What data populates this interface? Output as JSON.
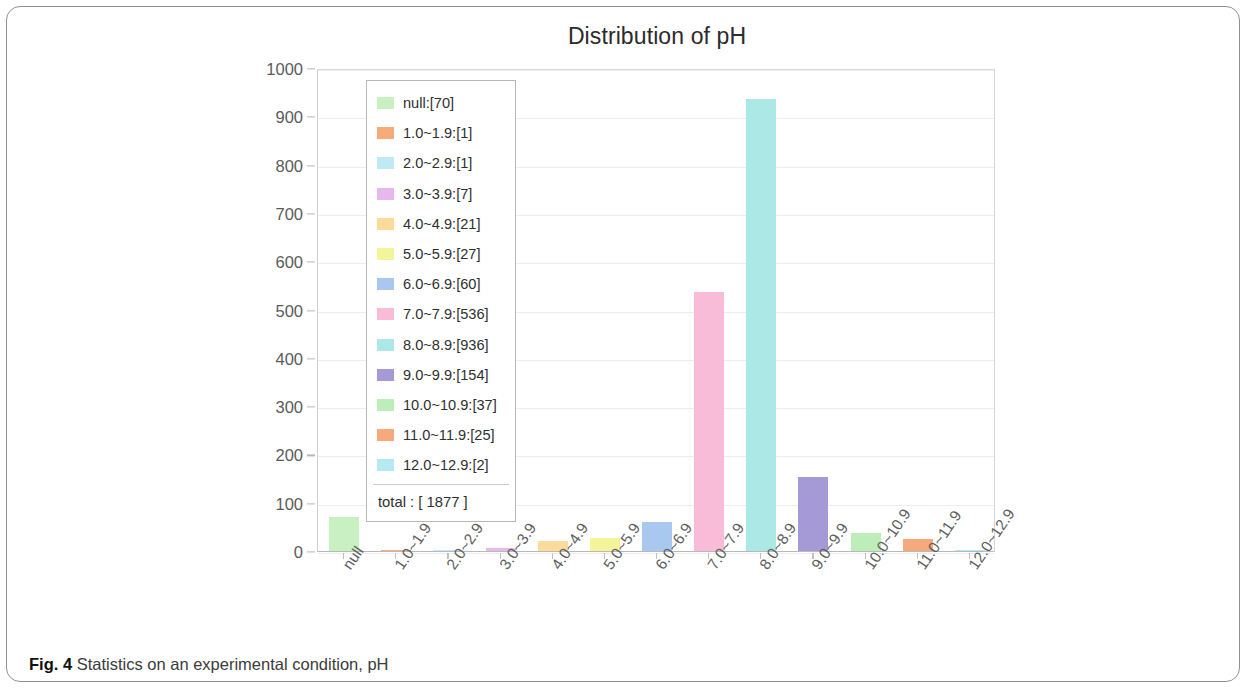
{
  "figure": {
    "caption_label": "Fig. 4",
    "caption_text": "Statistics on an experimental condition, pH"
  },
  "legend": {
    "total_label": "total : [ 1877 ]"
  },
  "chart_data": {
    "type": "bar",
    "title": "Distribution of pH",
    "xlabel": "",
    "ylabel": "",
    "ylim": [
      0,
      1000
    ],
    "ytick_step": 100,
    "yticks": [
      0,
      100,
      200,
      300,
      400,
      500,
      600,
      700,
      800,
      900,
      1000
    ],
    "grid": true,
    "legend_position": "inside-upper-left",
    "categories": [
      "null",
      "1.0~1.9",
      "2.0~2.9",
      "3.0~3.9",
      "4.0~4.9",
      "5.0~5.9",
      "6.0~6.9",
      "7.0~7.9",
      "8.0~8.9",
      "9.0~9.9",
      "10.0~10.9",
      "11.0~11.9",
      "12.0~12.9"
    ],
    "values": [
      70,
      1,
      1,
      7,
      21,
      27,
      60,
      536,
      936,
      154,
      37,
      25,
      2
    ],
    "colors": [
      "#c8f0c0",
      "#f6ab78",
      "#bfeaf5",
      "#e7b7ee",
      "#fbdb9a",
      "#f4f59a",
      "#a8c8f0",
      "#f8bcd8",
      "#ace9e6",
      "#a59ad6",
      "#bdeeba",
      "#f6a97c",
      "#b6eaf2"
    ],
    "legend_entries": [
      "null:[70]",
      "1.0~1.9:[1]",
      "2.0~2.9:[1]",
      "3.0~3.9:[7]",
      "4.0~4.9:[21]",
      "5.0~5.9:[27]",
      "6.0~6.9:[60]",
      "7.0~7.9:[536]",
      "8.0~8.9:[936]",
      "9.0~9.9:[154]",
      "10.0~10.9:[37]",
      "11.0~11.9:[25]",
      "12.0~12.9:[2]"
    ],
    "total": 1877
  }
}
